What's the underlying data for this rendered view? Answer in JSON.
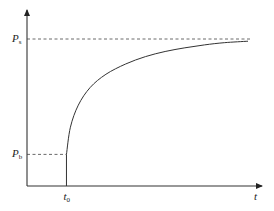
{
  "chart_data": {
    "type": "line",
    "title": "",
    "xlabel": "t",
    "ylabel": "",
    "x_ticks": [
      {
        "label": "t",
        "sub": "0",
        "value": 1
      }
    ],
    "y_ticks": [
      {
        "label": "P",
        "sub": "s",
        "value": 1.0
      },
      {
        "label": "P",
        "sub": "b",
        "value": 0.215
      }
    ],
    "xlim": [
      0,
      6
    ],
    "ylim": [
      0,
      1.15
    ],
    "series": [
      {
        "name": "pressure",
        "description": "curve rises from (t0, Pb) asymptotically toward Ps",
        "x": [
          1.0,
          1.1,
          1.3,
          1.6,
          2.0,
          2.5,
          3.0,
          3.5,
          4.0,
          4.5,
          5.0,
          5.6
        ],
        "y": [
          0.215,
          0.4,
          0.55,
          0.67,
          0.76,
          0.83,
          0.88,
          0.915,
          0.94,
          0.96,
          0.975,
          0.985
        ]
      }
    ],
    "reference_lines": [
      {
        "type": "horizontal",
        "label": "Ps",
        "value": 1.0,
        "style": "dashed"
      },
      {
        "type": "horizontal",
        "label": "Pb",
        "value": 0.215,
        "style": "dashed",
        "until_x": 1.0
      }
    ],
    "grid": false,
    "legend": "none"
  }
}
